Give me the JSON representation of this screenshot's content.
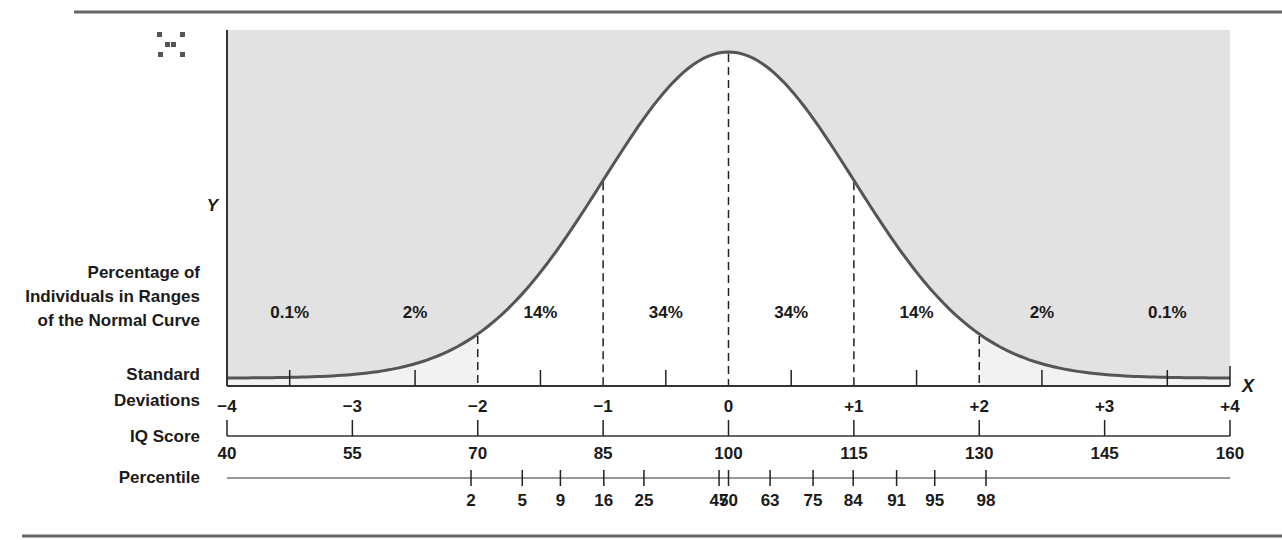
{
  "chart_data": {
    "type": "area",
    "title": "",
    "curve": {
      "mean": 0,
      "sd": 1,
      "xrange": [
        -4,
        4
      ]
    },
    "y_axis_label": "Y",
    "x_axis_label": "X",
    "row_labels": {
      "percentage": [
        "Percentage of",
        "Individuals in Ranges",
        "of the Normal Curve"
      ],
      "sd": [
        "Standard",
        "Deviations"
      ],
      "iq": "IQ Score",
      "percentile": "Percentile"
    },
    "regions": [
      {
        "from": -4,
        "to": -2,
        "label": "0.1%",
        "label_at": -3.5
      },
      {
        "from": -4,
        "to": -2,
        "label": "2%",
        "label_at": -2.5
      },
      {
        "from": -2,
        "to": -1,
        "label": "14%",
        "label_at": -1.5
      },
      {
        "from": -1,
        "to": 0,
        "label": "34%",
        "label_at": -0.5
      },
      {
        "from": 0,
        "to": 1,
        "label": "34%",
        "label_at": 0.5
      },
      {
        "from": 1,
        "to": 2,
        "label": "14%",
        "label_at": 1.5
      },
      {
        "from": 2,
        "to": 4,
        "label": "2%",
        "label_at": 2.5
      },
      {
        "from": 2,
        "to": 4,
        "label": "0.1%",
        "label_at": 3.5
      }
    ],
    "dashed_lines_at": [
      -2,
      -1,
      0,
      1,
      2
    ],
    "minor_ticks_at": [
      -3.5,
      -2.5,
      -1.5,
      -0.5,
      0.5,
      1.5,
      2.5,
      3.5
    ],
    "sd_ticks": [
      {
        "value": -4,
        "label": "−4"
      },
      {
        "value": -3,
        "label": "−3"
      },
      {
        "value": -2,
        "label": "−2"
      },
      {
        "value": -1,
        "label": "−1"
      },
      {
        "value": 0,
        "label": "0"
      },
      {
        "value": 1,
        "label": "+1"
      },
      {
        "value": 2,
        "label": "+2"
      },
      {
        "value": 3,
        "label": "+3"
      },
      {
        "value": 4,
        "label": "+4"
      }
    ],
    "iq_ticks": [
      {
        "sd": -4,
        "label": "40"
      },
      {
        "sd": -3,
        "label": "55"
      },
      {
        "sd": -2,
        "label": "70"
      },
      {
        "sd": -1,
        "label": "85"
      },
      {
        "sd": 0,
        "label": "100"
      },
      {
        "sd": 1,
        "label": "115"
      },
      {
        "sd": 2,
        "label": "130"
      },
      {
        "sd": 3,
        "label": "145"
      },
      {
        "sd": 4,
        "label": "160"
      }
    ],
    "percentile_ticks": [
      {
        "percentile": 2,
        "label": "2"
      },
      {
        "percentile": 5,
        "label": "5"
      },
      {
        "percentile": 9,
        "label": "9"
      },
      {
        "percentile": 16,
        "label": "16"
      },
      {
        "percentile": 25,
        "label": "25"
      },
      {
        "percentile": 47,
        "label": "47"
      },
      {
        "percentile": 50,
        "label": "50"
      },
      {
        "percentile": 63,
        "label": "63"
      },
      {
        "percentile": 75,
        "label": "75"
      },
      {
        "percentile": 84,
        "label": "84"
      },
      {
        "percentile": 91,
        "label": "91"
      },
      {
        "percentile": 95,
        "label": "95"
      },
      {
        "percentile": 98,
        "label": "98"
      }
    ],
    "colors": {
      "outer_fill": "#e2e2e2",
      "tail_fill": "#f2f2f2",
      "inner_fill": "#ffffff",
      "curve": "#555555",
      "text": "#1a1a1a",
      "rule": "#666666"
    }
  }
}
